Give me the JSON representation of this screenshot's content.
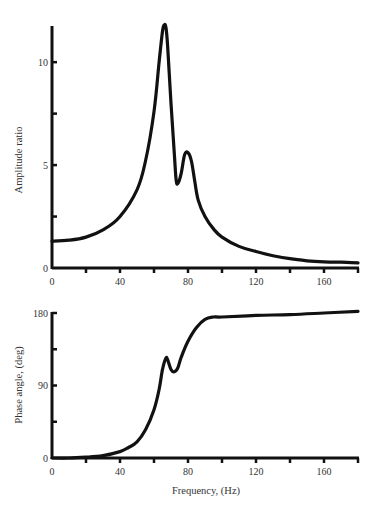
{
  "chart_data": [
    {
      "type": "line",
      "title": "",
      "xlabel": "",
      "ylabel": "Amplitude ratio",
      "xlim": [
        0,
        180
      ],
      "ylim": [
        0,
        12
      ],
      "grid": false,
      "legend": null,
      "x_ticks": [
        0,
        40,
        80,
        120,
        160
      ],
      "x_minor_ticks": [
        20,
        60,
        100,
        140,
        180
      ],
      "y_ticks": [
        0,
        5,
        10
      ],
      "y_minor_ticks": [
        2.5,
        7.5
      ],
      "series": [
        {
          "name": "Amplitude ratio",
          "x": [
            0,
            10,
            20,
            30,
            40,
            50,
            55,
            60,
            63,
            65,
            66,
            67,
            68,
            70,
            72,
            73,
            74,
            76,
            78,
            80,
            82,
            84,
            86,
            90,
            95,
            100,
            110,
            120,
            130,
            140,
            150,
            160,
            170,
            180
          ],
          "y": [
            1.3,
            1.35,
            1.5,
            1.85,
            2.5,
            3.8,
            5.2,
            7.6,
            10.0,
            11.5,
            11.8,
            11.7,
            10.8,
            8.0,
            5.5,
            4.3,
            4.1,
            4.6,
            5.5,
            5.6,
            5.2,
            4.2,
            3.3,
            2.5,
            1.9,
            1.5,
            1.05,
            0.8,
            0.6,
            0.45,
            0.35,
            0.3,
            0.28,
            0.25
          ]
        }
      ]
    },
    {
      "type": "line",
      "title": "",
      "xlabel": "Frequency, (Hz)",
      "ylabel": "Phase angle, (deg)",
      "xlim": [
        0,
        180
      ],
      "ylim": [
        0,
        180
      ],
      "grid": false,
      "legend": null,
      "x_ticks": [
        0,
        40,
        80,
        120,
        160
      ],
      "x_minor_ticks": [
        20,
        60,
        100,
        140,
        180
      ],
      "y_ticks": [
        0,
        90,
        180
      ],
      "y_minor_ticks": [
        45,
        135
      ],
      "series": [
        {
          "name": "Phase angle",
          "x": [
            0,
            10,
            20,
            30,
            40,
            45,
            50,
            55,
            60,
            63,
            65,
            67,
            68,
            70,
            72,
            74,
            76,
            80,
            85,
            90,
            95,
            100,
            120,
            140,
            160,
            180
          ],
          "y": [
            0,
            0,
            1,
            3,
            8,
            13,
            20,
            35,
            60,
            85,
            110,
            124,
            122,
            110,
            107,
            112,
            125,
            145,
            162,
            172,
            175,
            175,
            177,
            178,
            180,
            182
          ]
        }
      ]
    }
  ],
  "labels": {
    "top_ylabel": "Amplitude ratio",
    "bottom_ylabel": "Phase angle, (deg)",
    "bottom_xlabel": "Frequency, (Hz)",
    "top_x_ticks": [
      "0",
      "40",
      "80",
      "120",
      "160"
    ],
    "top_y_ticks": [
      "0",
      "5",
      "10"
    ],
    "bottom_x_ticks": [
      "0",
      "40",
      "80",
      "120",
      "160"
    ],
    "bottom_y_ticks": [
      "0",
      "90",
      "180"
    ]
  },
  "style": {
    "line_color": "#111111",
    "axis_color": "#111111",
    "text_color": "#333333"
  }
}
